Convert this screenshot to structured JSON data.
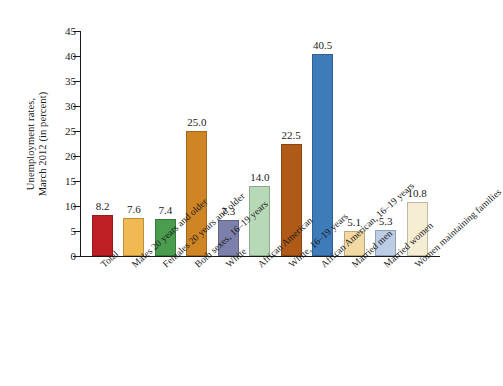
{
  "chart_data": {
    "type": "bar",
    "title": "",
    "subtitle": "",
    "xlabel": "",
    "ylabel": "Unemployment rates, March 2012 (in percent)",
    "ylabel_lines": [
      "Unemployment rates,",
      "March 2012 (in percent)"
    ],
    "ylim": [
      0,
      45
    ],
    "ytick_labels": [
      "0",
      "5",
      "10",
      "15",
      "20",
      "25",
      "30",
      "35",
      "40",
      "45"
    ],
    "yticks": [
      0,
      5,
      10,
      15,
      20,
      25,
      30,
      35,
      40,
      45
    ],
    "grid": false,
    "legend": "none",
    "value_labels_shown": true,
    "categories": [
      "Total",
      "Males 20 years and older",
      "Females 20 years and older",
      "Both sexes, 16–19 years",
      "White",
      "African American",
      "White, 16–19 years",
      "African American, 16–19 years",
      "Married men",
      "Married women",
      "Women maintaining families"
    ],
    "values": [
      8.2,
      7.6,
      7.4,
      25.0,
      7.3,
      14.0,
      22.5,
      40.5,
      5.1,
      5.3,
      10.8
    ],
    "value_labels": [
      "8.2",
      "7.6",
      "7.4",
      "25.0",
      "7.3",
      "14.0",
      "22.5",
      "40.5",
      "5.1",
      "5.3",
      "10.8"
    ],
    "colors": [
      "#bf2026",
      "#f0b953",
      "#4a9c4e",
      "#cf8524",
      "#7d80ab",
      "#b8d9b8",
      "#b05a18",
      "#3d7cb9",
      "#f3d9a3",
      "#bccde5",
      "#f6eed4"
    ]
  }
}
